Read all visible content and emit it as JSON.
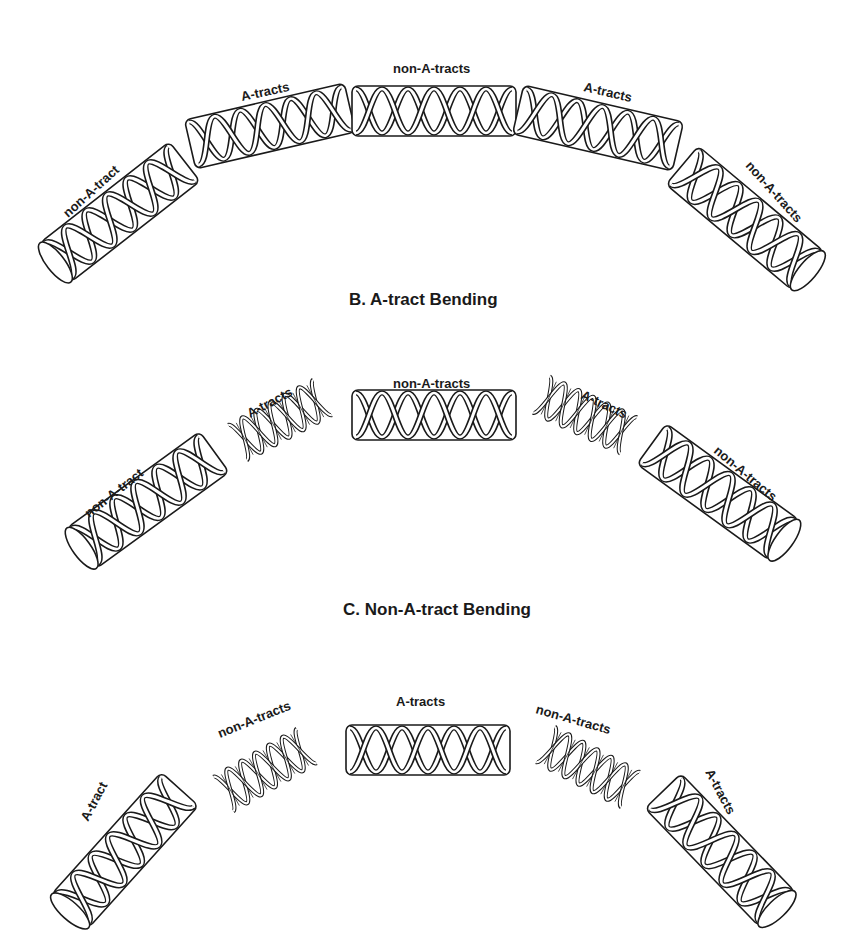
{
  "figure": {
    "background": "#ffffff",
    "ink_color": "#1a1a1a",
    "panels": [
      {
        "id": "A",
        "title": "",
        "segments": [
          {
            "label": "non-A-tract",
            "style": "cylinder"
          },
          {
            "label": "A-tracts",
            "style": "cylinder"
          },
          {
            "label": "non-A-tracts",
            "style": "cylinder"
          },
          {
            "label": "A-tracts",
            "style": "cylinder"
          },
          {
            "label": "non-A-tracts",
            "style": "cylinder"
          }
        ]
      },
      {
        "id": "B",
        "title": "B.  A-tract Bending",
        "segments": [
          {
            "label": "non-A-tract",
            "style": "cylinder"
          },
          {
            "label": "A-tracts",
            "style": "helix"
          },
          {
            "label": "non-A-tracts",
            "style": "cylinder"
          },
          {
            "label": "A-tracts",
            "style": "helix"
          },
          {
            "label": "non-A-tracts",
            "style": "cylinder"
          }
        ]
      },
      {
        "id": "C",
        "title": "C.  Non-A-tract Bending",
        "segments": [
          {
            "label": "A-tract",
            "style": "cylinder"
          },
          {
            "label": "non-A-tracts",
            "style": "helix"
          },
          {
            "label": "A-tracts",
            "style": "cylinder"
          },
          {
            "label": "non-A-tracts",
            "style": "helix"
          },
          {
            "label": "A-tracts",
            "style": "cylinder"
          }
        ]
      }
    ]
  }
}
